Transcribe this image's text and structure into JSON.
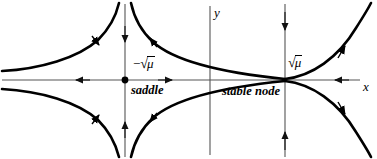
{
  "figure": {
    "type": "phase-portrait",
    "background_color": "#ffffff",
    "curve_color": "#000000",
    "axis_color": "#555555"
  },
  "axes": {
    "x_label": "x",
    "y_label": "y",
    "x_axis_y_px": 80,
    "y_axis_x_px": 210
  },
  "fixed_points": [
    {
      "id": "saddle",
      "coordinate_label": "−√μ",
      "radical_sign": "√",
      "radical_argument": "μ",
      "negative_sign": "−",
      "type_label": "saddle",
      "x_px": 125,
      "y_px": 80,
      "marker": "filled-dot"
    },
    {
      "id": "stable-node",
      "coordinate_label": "√μ",
      "radical_sign": "√",
      "radical_argument": "μ",
      "negative_sign": "",
      "type_label": "stable node",
      "x_px": 285,
      "y_px": 80,
      "marker": "convergence"
    }
  ],
  "flow_arrows": [
    {
      "id": "x-axis-far-left",
      "direction": "left",
      "x_px": 78,
      "y_px": 80
    },
    {
      "id": "x-axis-between",
      "direction": "right",
      "x_px": 172,
      "y_px": 80
    },
    {
      "id": "x-axis-far-right",
      "direction": "left",
      "x_px": 335,
      "y_px": 80
    },
    {
      "id": "saddle-vline-top",
      "direction": "down",
      "x_px": 125,
      "y_px": 40
    },
    {
      "id": "saddle-vline-bot",
      "direction": "up",
      "x_px": 125,
      "y_px": 122
    },
    {
      "id": "node-vline-top",
      "direction": "down",
      "x_px": 285,
      "y_px": 28
    },
    {
      "id": "node-vline-bot",
      "direction": "up",
      "x_px": 285,
      "y_px": 132
    }
  ],
  "trajectories": [
    {
      "id": "upper-left-incoming",
      "quadrant": "upper-left",
      "arrow_direction": "down-right"
    },
    {
      "id": "upper-mid-outgoing",
      "quadrant": "upper-mid",
      "arrow_direction": "up-left"
    },
    {
      "id": "lower-left-incoming",
      "quadrant": "lower-left",
      "arrow_direction": "down-right"
    },
    {
      "id": "lower-mid-outgoing",
      "quadrant": "lower-mid",
      "arrow_direction": "up-right"
    },
    {
      "id": "node-upper-branch",
      "quadrant": "upper-right",
      "arrow_direction": "up-right"
    },
    {
      "id": "node-lower-branch",
      "quadrant": "lower-right",
      "arrow_direction": "down-right"
    }
  ]
}
